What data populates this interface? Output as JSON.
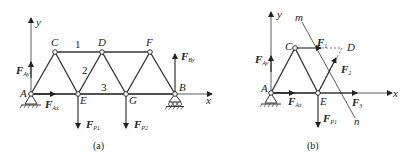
{
  "figure_a": {
    "caption": "(a)",
    "axis_x": "x",
    "axis_y": "y",
    "nodes": [
      "A",
      "C",
      "D",
      "F",
      "E",
      "G",
      "B"
    ],
    "member_labels": [
      "1",
      "2",
      "3"
    ],
    "forces": {
      "Ay": {
        "main": "F",
        "sub": "Ay"
      },
      "Ax": {
        "main": "F",
        "sub": "Ax"
      },
      "By": {
        "main": "F",
        "sub": "By"
      },
      "P1": {
        "main": "F",
        "sub": "P1"
      },
      "P2": {
        "main": "F",
        "sub": "P2"
      }
    }
  },
  "figure_b": {
    "caption": "(b)",
    "axis_x": "x",
    "axis_y": "y",
    "nodes": [
      "A",
      "C",
      "E",
      "D"
    ],
    "section_labels": [
      "m",
      "n"
    ],
    "forces": {
      "Ay": {
        "main": "F",
        "sub": "Ay"
      },
      "Ax": {
        "main": "F",
        "sub": "Ax"
      },
      "P1": {
        "main": "F",
        "sub": "P1"
      },
      "F1": {
        "main": "F",
        "sub": "1"
      },
      "F2": {
        "main": "F",
        "sub": "2"
      },
      "F3": {
        "main": "F",
        "sub": "3"
      }
    }
  }
}
